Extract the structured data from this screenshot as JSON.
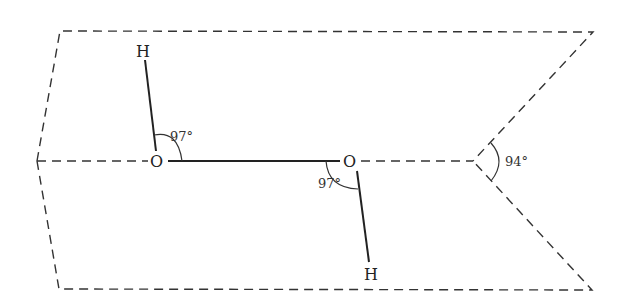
{
  "diagram": {
    "title": "",
    "atoms": [
      {
        "id": "H1",
        "label": "H",
        "x": 143,
        "y": 50
      },
      {
        "id": "O1",
        "label": "O",
        "x": 157,
        "y": 161
      },
      {
        "id": "O2",
        "label": "O",
        "x": 350,
        "y": 161
      },
      {
        "id": "H2",
        "label": "H",
        "x": 371,
        "y": 273
      }
    ],
    "bonds": [
      {
        "from": "H1",
        "to": "O1",
        "style": "solid"
      },
      {
        "from": "O1",
        "to": "O2",
        "style": "solid"
      },
      {
        "from": "O2",
        "to": "H2",
        "style": "solid"
      }
    ],
    "angles": [
      {
        "label": "97°",
        "at": "O1"
      },
      {
        "label": "97°",
        "at": "O2"
      },
      {
        "label": "94°",
        "at": "dihedral-vertex"
      }
    ],
    "planes": {
      "style": "dashed",
      "description": "Two dashed planes meeting along O–O axis forming a dihedral angle"
    }
  }
}
